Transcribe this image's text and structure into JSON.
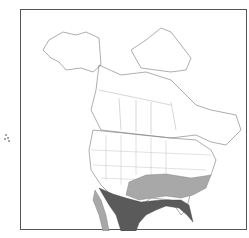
{
  "map": {
    "title": "North America range map",
    "region": "North America",
    "legend": [
      {
        "label": "Breeding range",
        "color": "#a8a8a8"
      },
      {
        "label": "Year-round range",
        "color": "#5a5a5a"
      }
    ],
    "colors": {
      "land": "#ffffff",
      "border": "#555555",
      "breeding": "#a8a8a8",
      "year_round": "#5a5a5a"
    }
  }
}
